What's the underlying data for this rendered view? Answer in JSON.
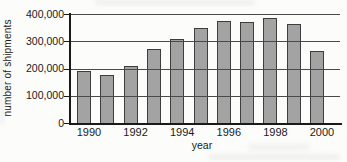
{
  "chart_data": {
    "type": "bar",
    "title": "",
    "xlabel": "year",
    "ylabel": "number of shipments",
    "categories": [
      "1990",
      "1991",
      "1992",
      "1993",
      "1994",
      "1995",
      "1996",
      "1997",
      "1998",
      "1999",
      "2000"
    ],
    "values": [
      190000,
      175000,
      210000,
      270000,
      310000,
      350000,
      375000,
      370000,
      385000,
      365000,
      265000
    ],
    "ylim": [
      0,
      400000
    ],
    "ytick_values": [
      0,
      100000,
      200000,
      300000,
      400000
    ],
    "ytick_labels": [
      "0",
      "100,000",
      "200,000",
      "300,000",
      "400,000"
    ],
    "xtick_labels": [
      "1990",
      "1992",
      "1994",
      "1996",
      "1998",
      "2000"
    ],
    "xtick_shown_every": 2,
    "grid": true,
    "gridlines_over_bars": true,
    "legend": null,
    "colors": {
      "bar_fill": "#a3a3a3",
      "bar_border": "#3d3d3d",
      "axis": "#1a1a1a",
      "gridline": "#4a4a4a",
      "text": "#1a1a1a",
      "background": "#fcfcfb"
    }
  }
}
